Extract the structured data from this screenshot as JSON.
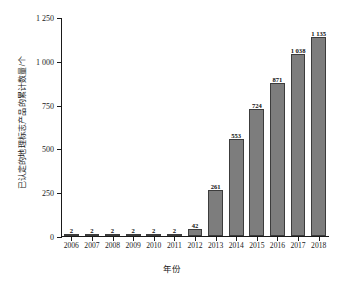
{
  "chart_data": {
    "type": "bar",
    "title": "",
    "xlabel": "年份",
    "ylabel": "已认定的地理标志产品的累计数量/个",
    "categories": [
      "2006",
      "2007",
      "2008",
      "2009",
      "2010",
      "2011",
      "2012",
      "2013",
      "2014",
      "2015",
      "2016",
      "2017",
      "2018"
    ],
    "values": [
      2,
      2,
      2,
      2,
      2,
      2,
      42,
      261,
      553,
      724,
      871,
      1038,
      1135
    ],
    "value_labels": [
      "2",
      "2",
      "2",
      "2",
      "2",
      "2",
      "42",
      "261",
      "553",
      "724",
      "871",
      "1 038",
      "1 135"
    ],
    "ylim": [
      0,
      1250
    ],
    "yticks": [
      0,
      250,
      500,
      750,
      1000,
      1250
    ],
    "ytick_labels": [
      "0",
      "250",
      "500",
      "750",
      "1 000",
      "1 250"
    ],
    "grid": false,
    "legend": null,
    "bar_color": "#7d7d7d",
    "bar_edge_color": "#3c3c3c",
    "axis_color": "#1a1a1a"
  }
}
